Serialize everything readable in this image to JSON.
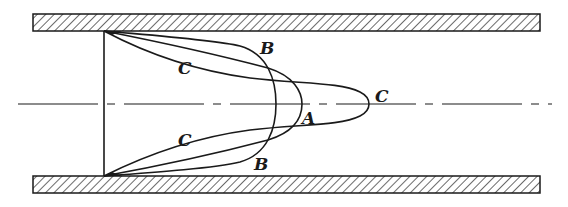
{
  "figure": {
    "colors": {
      "ink": "#1a1a1a",
      "background": "#ffffff"
    },
    "pipe": {
      "top_wall": {
        "x": 33,
        "y": 14,
        "width": 507,
        "height": 17
      },
      "bottom_wall": {
        "x": 33,
        "y": 176,
        "width": 507,
        "height": 17
      },
      "centerline_y": 104,
      "inlet_x": 104
    },
    "curves": [
      {
        "id": "B",
        "type": "flat-turbulent",
        "apex_x": 276
      },
      {
        "id": "A",
        "type": "parabolic",
        "apex_x": 302
      },
      {
        "id": "C",
        "type": "elongated",
        "apex_x": 372
      }
    ],
    "labels": [
      {
        "text": "B",
        "x": 260,
        "y": 54
      },
      {
        "text": "C",
        "x": 178,
        "y": 74
      },
      {
        "text": "C",
        "x": 375,
        "y": 102
      },
      {
        "text": "A",
        "x": 302,
        "y": 124
      },
      {
        "text": "C",
        "x": 178,
        "y": 146
      },
      {
        "text": "B",
        "x": 254,
        "y": 170
      }
    ]
  }
}
